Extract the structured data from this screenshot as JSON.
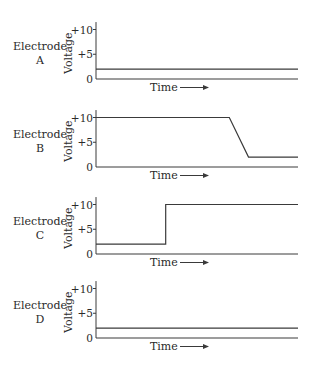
{
  "chart_data": [
    {
      "type": "line",
      "title": "Electrode A",
      "electrode_label": "Electrode",
      "electrode_letter": "A",
      "xlabel": "Time",
      "ylabel": "Voltage",
      "yticks": [
        "0",
        "+5",
        "+10"
      ],
      "ylim": [
        0,
        11.5
      ],
      "xlim": [
        0,
        1
      ],
      "points": [
        [
          0,
          2
        ],
        [
          1,
          2
        ]
      ]
    },
    {
      "type": "line",
      "title": "Electrode B",
      "electrode_label": "Electrode",
      "electrode_letter": "B",
      "xlabel": "Time",
      "ylabel": "Voltage",
      "yticks": [
        "0",
        "+5",
        "+10"
      ],
      "ylim": [
        0,
        11.5
      ],
      "xlim": [
        0,
        1
      ],
      "points": [
        [
          0,
          10
        ],
        [
          0.66,
          10
        ],
        [
          0.755,
          2
        ],
        [
          1,
          2
        ]
      ]
    },
    {
      "type": "line",
      "title": "Electrode C",
      "electrode_label": "Electrode",
      "electrode_letter": "C",
      "xlabel": "Time",
      "ylabel": "Voltage",
      "yticks": [
        "0",
        "+5",
        "+10"
      ],
      "ylim": [
        0,
        11.5
      ],
      "xlim": [
        0,
        1
      ],
      "points": [
        [
          0,
          2
        ],
        [
          0.345,
          2
        ],
        [
          0.345,
          10
        ],
        [
          1,
          10
        ]
      ]
    },
    {
      "type": "line",
      "title": "Electrode D",
      "electrode_label": "Electrode",
      "electrode_letter": "D",
      "xlabel": "Time",
      "ylabel": "Voltage",
      "yticks": [
        "0",
        "+5",
        "+10"
      ],
      "ylim": [
        0,
        11.5
      ],
      "xlim": [
        0,
        1
      ],
      "points": [
        [
          0,
          2
        ],
        [
          1,
          2
        ]
      ]
    }
  ],
  "colors": {
    "ink": "#3a3a3a",
    "text": "#2a2a2a"
  }
}
